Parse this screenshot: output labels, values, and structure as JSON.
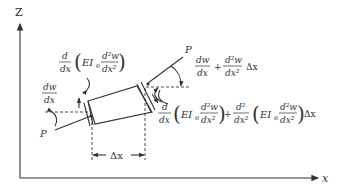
{
  "diagram": {
    "axes": {
      "vertical_label": "Z",
      "horizontal_label": "x"
    },
    "loads": {
      "left_force": "P",
      "right_force": "P"
    },
    "left_slope": {
      "numerator": "dw",
      "denominator": "dx"
    },
    "right_slope": {
      "term1_num": "dw",
      "term1_den": "dx",
      "plus": "+",
      "term2_num": "d²w",
      "term2_den": "dx²",
      "suffix": "Δx"
    },
    "left_moment": {
      "d_num": "d",
      "d_den": "dx",
      "EI": "EI",
      "EI_sub": "e",
      "inner_num": "d²w",
      "inner_den": "dx²"
    },
    "right_moment": {
      "d_num": "d",
      "d_den": "dx",
      "EI": "EI",
      "EI_sub": "e",
      "inner_num": "d²w",
      "inner_den": "dx²",
      "plus": "+",
      "d2_num": "d²",
      "d2_den": "dx²",
      "EI2": "EI",
      "EI2_sub": "e",
      "inner2_num": "d²w",
      "inner2_den": "dx²",
      "suffix": "Δx"
    },
    "element_length": "Δx"
  }
}
